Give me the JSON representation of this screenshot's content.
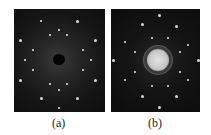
{
  "figure": {
    "panels": [
      {
        "id": "a",
        "label": "(a)",
        "description": "diffraction pattern with dark central beam stop"
      },
      {
        "id": "b",
        "label": "(b)",
        "description": "diffraction pattern with bright central disc"
      }
    ]
  }
}
